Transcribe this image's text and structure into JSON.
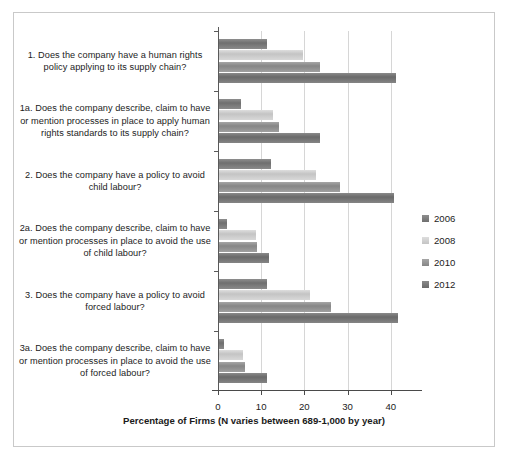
{
  "chart_data": {
    "type": "bar",
    "orientation": "horizontal",
    "title": "",
    "xlabel": "Percentage of Firms (N varies between 689-1,000 by year)",
    "ylabel": "",
    "xlim": [
      0,
      44
    ],
    "xticks": [
      0,
      10,
      20,
      30,
      40
    ],
    "xticklabels": [
      "0",
      "10",
      "20",
      "30",
      "40"
    ],
    "grid": "vertical gridlines at 10, 20, 30, 40",
    "legend_position": "right, vertically centered",
    "categories": [
      "1. Does the company have a human rights policy applying to its supply chain?",
      "1a. Does the company describe, claim to have or mention processes in place to apply human rights standards to its supply chain?",
      "2. Does the company have a policy to avoid child labour?",
      "2a. Does the company describe, claim to have or mention processes in place to avoid the use of child labour?",
      "3. Does the company have a policy to avoid forced labour?",
      "3a. Does the company describe, claim to have or mention processes in place to avoid the use of forced labour?"
    ],
    "series": [
      {
        "name": "2006",
        "color": "#6f6f6f",
        "values": [
          11,
          5,
          12,
          1.8,
          11,
          1.2
        ]
      },
      {
        "name": "2008",
        "color": "#d4d4d4",
        "values": [
          19.5,
          12.5,
          22.5,
          8.5,
          21,
          5.5
        ]
      },
      {
        "name": "2010",
        "color": "#8f8f8f",
        "values": [
          23.5,
          14,
          28,
          8.8,
          26,
          6
        ]
      },
      {
        "name": "2012",
        "color": "#6f6f6f",
        "values": [
          41,
          23.5,
          40.5,
          11.5,
          41.5,
          11
        ]
      }
    ]
  },
  "legend": {
    "items": [
      {
        "label": "2006"
      },
      {
        "label": "2008"
      },
      {
        "label": "2010"
      },
      {
        "label": "2012"
      }
    ]
  }
}
